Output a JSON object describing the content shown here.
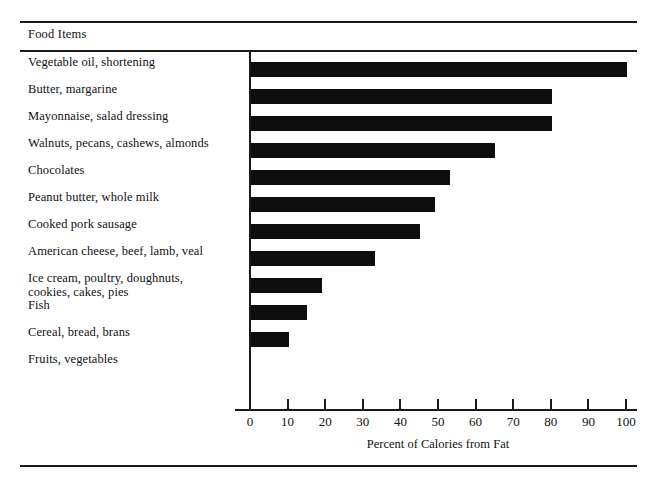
{
  "figure": {
    "column_header": "Food Items",
    "axis_title": "Percent of Calories from Fat",
    "ink_color": "#0d0d0d",
    "background_color": "#ffffff"
  },
  "chart_data": {
    "type": "bar",
    "orientation": "horizontal",
    "title": "",
    "subtitle": "",
    "xlabel": "Percent of Calories from Fat",
    "ylabel": "Food Items",
    "xlim": [
      0,
      100
    ],
    "xticks": [
      0,
      10,
      20,
      30,
      40,
      50,
      60,
      70,
      80,
      90,
      100
    ],
    "xticklabels": [
      "0",
      "10",
      "20",
      "30",
      "40",
      "50",
      "60",
      "70",
      "80",
      "90",
      "100"
    ],
    "grid": false,
    "legend": null,
    "categories": [
      "Vegetable oil, shortening",
      "Butter, margarine",
      "Mayonnaise, salad dressing",
      "Walnuts, pecans, cashews, almonds",
      "Chocolates",
      "Peanut butter, whole milk",
      "Cooked pork sausage",
      "American cheese, beef, lamb, veal",
      "Ice cream, poultry, doughnuts, cookies, cakes, pies",
      "Fish",
      "Cereal, bread, brans",
      "Fruits, vegetables"
    ],
    "values": [
      100,
      80,
      80,
      65,
      53,
      49,
      45,
      33,
      19,
      15,
      10,
      0
    ]
  },
  "rows": [
    {
      "label_line1": "Vegetable oil, shortening",
      "label_line2": "",
      "value": 100
    },
    {
      "label_line1": "Butter, margarine",
      "label_line2": "",
      "value": 80
    },
    {
      "label_line1": "Mayonnaise, salad dressing",
      "label_line2": "",
      "value": 80
    },
    {
      "label_line1": "Walnuts, pecans, cashews, almonds",
      "label_line2": "",
      "value": 65
    },
    {
      "label_line1": "Chocolates",
      "label_line2": "",
      "value": 53
    },
    {
      "label_line1": "Peanut butter, whole milk",
      "label_line2": "",
      "value": 49
    },
    {
      "label_line1": "Cooked pork sausage",
      "label_line2": "",
      "value": 45
    },
    {
      "label_line1": "American cheese, beef, lamb, veal",
      "label_line2": "",
      "value": 33
    },
    {
      "label_line1": "Ice cream, poultry, doughnuts,",
      "label_line2": "cookies, cakes, pies",
      "value": 19
    },
    {
      "label_line1": "Fish",
      "label_line2": "",
      "value": 15
    },
    {
      "label_line1": "Cereal, bread, brans",
      "label_line2": "",
      "value": 10
    },
    {
      "label_line1": "Fruits, vegetables",
      "label_line2": "",
      "value": 0
    }
  ]
}
